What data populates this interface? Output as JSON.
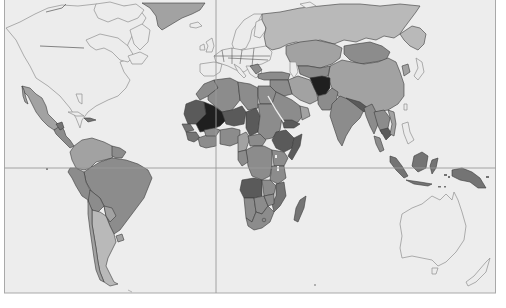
{
  "map": {
    "type": "choropleth",
    "projection": "world",
    "colors": {
      "background": "#ededed",
      "frame": "#a9a9a9",
      "gridline": "#9a9a9a",
      "no_data_fill": "#ececec",
      "no_data_stroke": "#8f8f8f",
      "level_1": "#b9b9b9",
      "level_2": "#a2a2a2",
      "level_3": "#8c8c8c",
      "level_4": "#747474",
      "level_5": "#5a5a5a",
      "level_6": "#1f1f1f"
    },
    "gridlines": {
      "equator_y": 168,
      "prime_meridian_x": 216
    },
    "regions": [
      {
        "name": "North America (US/Canada)",
        "level": "no_data"
      },
      {
        "name": "Greenland",
        "level": "level_2"
      },
      {
        "name": "Mexico",
        "level": "level_2"
      },
      {
        "name": "Central America",
        "level": "level_3"
      },
      {
        "name": "Haiti",
        "level": "level_4"
      },
      {
        "name": "Venezuela/Colombia/Guianas",
        "level": "level_2"
      },
      {
        "name": "Brazil",
        "level": "level_3"
      },
      {
        "name": "Peru/Bolivia",
        "level": "level_3"
      },
      {
        "name": "Argentina/Chile",
        "level": "level_2"
      },
      {
        "name": "Europe",
        "level": "no_data"
      },
      {
        "name": "Russia",
        "level": "level_1"
      },
      {
        "name": "Kazakhstan/Central Asia",
        "level": "level_2"
      },
      {
        "name": "Mongolia",
        "level": "level_3"
      },
      {
        "name": "China",
        "level": "level_2"
      },
      {
        "name": "Turkey/Middle East",
        "level": "level_3"
      },
      {
        "name": "Afghanistan",
        "level": "level_6"
      },
      {
        "name": "Pakistan",
        "level": "level_3"
      },
      {
        "name": "India",
        "level": "level_3"
      },
      {
        "name": "Southeast Asia",
        "level": "level_3"
      },
      {
        "name": "Cambodia",
        "level": "level_5"
      },
      {
        "name": "Indonesia/Papua",
        "level": "level_4"
      },
      {
        "name": "North Africa",
        "level": "level_3"
      },
      {
        "name": "Mali",
        "level": "level_6"
      },
      {
        "name": "Niger/Chad",
        "level": "level_4"
      },
      {
        "name": "Sudan",
        "level": "level_3"
      },
      {
        "name": "Ethiopia",
        "level": "level_5"
      },
      {
        "name": "Central Africa",
        "level": "level_3"
      },
      {
        "name": "Angola",
        "level": "level_5"
      },
      {
        "name": "Southern Africa",
        "level": "level_3"
      },
      {
        "name": "Madagascar",
        "level": "level_4"
      },
      {
        "name": "Australia",
        "level": "no_data"
      },
      {
        "name": "New Zealand",
        "level": "no_data"
      }
    ]
  }
}
